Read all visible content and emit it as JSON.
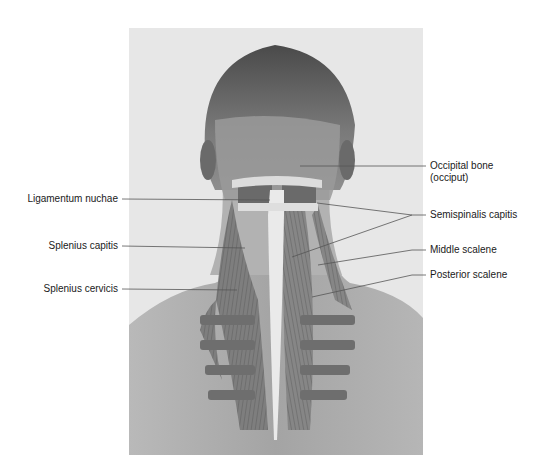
{
  "figure": {
    "colors": {
      "background": "#ffffff",
      "panel_bg": "#e6e6e6",
      "skin": "#a8a8a8",
      "hair": "#5a5a5a",
      "muscle": "#7c7c7c",
      "ligament": "#e8e8e8",
      "leader_line": "#555555"
    }
  },
  "labels_left": [
    {
      "text": "Ligamentum nuchae"
    },
    {
      "text": "Splenius capitis"
    },
    {
      "text": "Splenius cervicis"
    }
  ],
  "labels_right": [
    {
      "text": "Occipital bone",
      "text2": "(occiput)"
    },
    {
      "text": "Semispinalis capitis"
    },
    {
      "text": "Middle scalene"
    },
    {
      "text": "Posterior scalene"
    }
  ]
}
